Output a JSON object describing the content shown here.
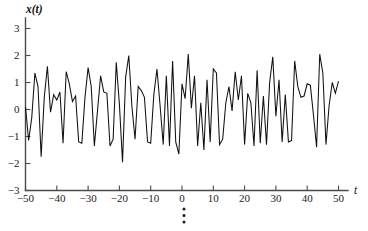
{
  "figure": {
    "background_color": "#ffffff",
    "line_color": "#111111",
    "axis_color": "#4a4a52",
    "continuation_marker": "vertical-ellipsis"
  },
  "labels": {
    "y_axis_title": "x(t)",
    "x_axis_title": "t",
    "y_ticks": [
      "3",
      "2",
      "1",
      "0",
      "-1",
      "-2",
      "-3"
    ],
    "x_ticks": [
      "-50",
      "-40",
      "-30",
      "-20",
      "-10",
      "0",
      "10",
      "20",
      "30",
      "40",
      "50"
    ]
  },
  "chart_data": {
    "type": "line",
    "title": "",
    "subtitle": "",
    "xlabel": "t",
    "ylabel": "x(t)",
    "xlim": [
      -50,
      50
    ],
    "ylim": [
      -3,
      3
    ],
    "xticks": [
      -50,
      -40,
      -30,
      -20,
      -10,
      0,
      10,
      20,
      30,
      40,
      50
    ],
    "yticks": [
      3,
      2,
      1,
      0,
      -1,
      -2,
      -3
    ],
    "grid": false,
    "legend": null,
    "legend_position": "none",
    "annotations": [
      "vertical ellipsis below plot indicating continuation"
    ],
    "series": [
      {
        "name": "x(t)",
        "color": "#111111",
        "x": [
          -50,
          -49,
          -48,
          -47,
          -46,
          -45,
          -44,
          -43,
          -42,
          -41,
          -40,
          -39,
          -38,
          -37,
          -36,
          -35,
          -34,
          -33,
          -32,
          -31,
          -30,
          -29,
          -28,
          -27,
          -26,
          -25,
          -24,
          -23,
          -22,
          -21,
          -20,
          -19,
          -18,
          -17,
          -16,
          -15,
          -14,
          -13,
          -12,
          -11,
          -10,
          -9,
          -8,
          -7,
          -6,
          -5,
          -4,
          -3,
          -2,
          -1,
          0,
          1,
          2,
          3,
          4,
          5,
          6,
          7,
          8,
          9,
          10,
          11,
          12,
          13,
          14,
          15,
          16,
          17,
          18,
          19,
          20,
          21,
          22,
          23,
          24,
          25,
          26,
          27,
          28,
          29,
          30,
          31,
          32,
          33,
          34,
          35,
          36,
          37,
          38,
          39,
          40,
          41,
          42,
          43,
          44,
          45,
          46,
          47,
          48,
          49,
          50
        ],
        "values": [
          0.1,
          -1.15,
          -0.3,
          1.35,
          0.85,
          -1.75,
          0.45,
          1.6,
          -0.1,
          0.55,
          0.35,
          0.65,
          -1.25,
          1.4,
          0.95,
          0.3,
          0.5,
          -1.2,
          -1.25,
          0.45,
          1.55,
          0.85,
          -1.35,
          -0.05,
          1.25,
          0.65,
          0.6,
          -1.35,
          -1.1,
          1.75,
          0.2,
          -1.95,
          1.2,
          2.0,
          0.1,
          -1.1,
          0.85,
          0.7,
          0.45,
          -1.2,
          -1.25,
          0.55,
          1.5,
          0.15,
          -1.3,
          1.25,
          -1.35,
          1.8,
          -1.2,
          -1.65,
          0.95,
          0.4,
          2.05,
          0.05,
          1.25,
          -1.35,
          0.25,
          -1.5,
          1.1,
          -1.2,
          1.5,
          1.35,
          -1.3,
          -1.1,
          0.25,
          0.85,
          -0.05,
          1.4,
          0.35,
          1.25,
          -1.3,
          0.6,
          0.25,
          -1.35,
          1.45,
          -1.25,
          0.5,
          -1.3,
          1.0,
          1.95,
          -0.25,
          1.1,
          -1.2,
          0.55,
          -1.2,
          -1.15,
          1.8,
          0.85,
          0.45,
          0.5,
          0.95,
          0.9,
          -0.2,
          -1.4,
          2.05,
          1.35,
          -1.3,
          0.15,
          1.0,
          0.6,
          1.05
        ]
      }
    ]
  }
}
